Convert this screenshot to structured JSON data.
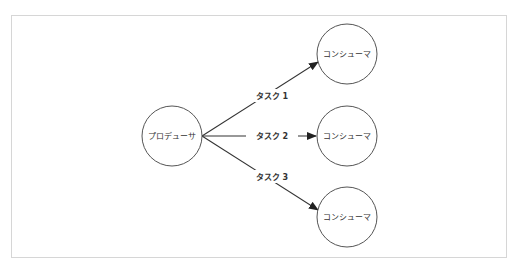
{
  "diagram": {
    "type": "producer-consumer",
    "colors": {
      "frame_border": "#d6d6d6",
      "node_stroke": "#555555",
      "edge_stroke": "#333333",
      "text": "#333333"
    },
    "producer": {
      "label": "プロデューサ"
    },
    "consumers": [
      {
        "label": "コンシューマ"
      },
      {
        "label": "コンシューマ"
      },
      {
        "label": "コンシューマ"
      }
    ],
    "edges": [
      {
        "from": "producer",
        "to": "consumer-1",
        "label": "タスク 1"
      },
      {
        "from": "producer",
        "to": "consumer-2",
        "label": "タスク 2"
      },
      {
        "from": "producer",
        "to": "consumer-3",
        "label": "タスク 3"
      }
    ]
  }
}
